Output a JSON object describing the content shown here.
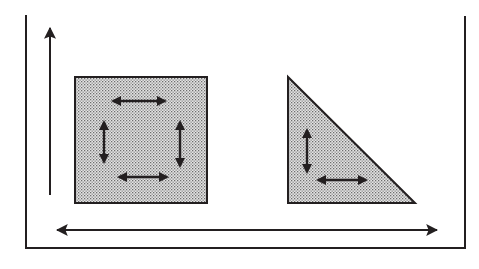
{
  "diagram": {
    "colors": {
      "background": "#ffffff",
      "ink": "#231f20",
      "fill": "#d9d9d9",
      "dot": "#6e6e6e"
    },
    "frame": {
      "left_x": 26,
      "right_x": 465,
      "top_left_y": 15,
      "top_right_y": 16,
      "bottom_y": 248
    },
    "vertical_axis_arrow": {
      "x": 50,
      "y_start": 195,
      "y_end": 28,
      "direction": "up"
    },
    "horizontal_axis_arrow": {
      "y": 230,
      "x_start": 57,
      "x_end": 437,
      "direction": "both"
    },
    "square": {
      "x": 75,
      "y": 77,
      "width": 132,
      "height": 126,
      "arrows": [
        {
          "orientation": "horizontal",
          "x1": 113,
          "y1": 101,
          "x2": 165,
          "y2": 101
        },
        {
          "orientation": "vertical",
          "x1": 104,
          "y1": 122,
          "x2": 104,
          "y2": 162
        },
        {
          "orientation": "vertical",
          "x1": 180,
          "y1": 122,
          "x2": 180,
          "y2": 166
        },
        {
          "orientation": "horizontal",
          "x1": 119,
          "y1": 177,
          "x2": 167,
          "y2": 177
        }
      ]
    },
    "triangle": {
      "points": [
        [
          288,
          77
        ],
        [
          288,
          203
        ],
        [
          415,
          203
        ]
      ],
      "arrows": [
        {
          "orientation": "vertical",
          "x1": 307,
          "y1": 130,
          "x2": 307,
          "y2": 172
        },
        {
          "orientation": "horizontal",
          "x1": 318,
          "y1": 180,
          "x2": 366,
          "y2": 180
        }
      ]
    }
  }
}
